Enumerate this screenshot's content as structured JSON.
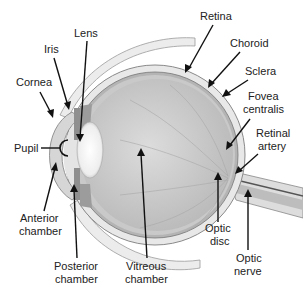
{
  "diagram": {
    "labels": {
      "lens": "Lens",
      "iris": "Iris",
      "cornea": "Cornea",
      "pupil": "Pupil",
      "anterior_1": "Anterior",
      "anterior_2": "chamber",
      "posterior_1": "Posterior",
      "posterior_2": "chamber",
      "vitreous_1": "Vitreous",
      "vitreous_2": "chamber",
      "retina": "Retina",
      "choroid": "Choroid",
      "sclera": "Sclera",
      "fovea_1": "Fovea",
      "fovea_2": "centralis",
      "retinal_artery_1": "Retinal",
      "retinal_artery_2": "artery",
      "optic_disc_1": "Optic",
      "optic_disc_2": "disc",
      "optic_nerve_1": "Optic",
      "optic_nerve_2": "nerve"
    },
    "colors": {
      "sclera": "#e6e6e6",
      "choroid": "#a8a8a8",
      "vitreous": "#cfcfcf",
      "lens": "#f4f4f4",
      "text": "#222222",
      "arrow": "#111111"
    }
  }
}
